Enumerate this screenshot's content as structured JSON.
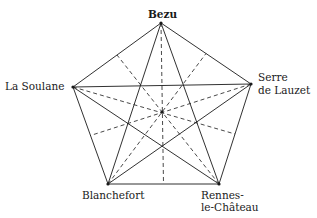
{
  "diagram": {
    "type": "pentagram-in-pentagon",
    "line_color": "#1a1a1a",
    "vertices": [
      {
        "id": "bezu",
        "label_lines": [
          "Bezu"
        ],
        "x": 161,
        "y": 23
      },
      {
        "id": "serre",
        "label_lines": [
          "Serre",
          "de Lauzet"
        ],
        "x": 251,
        "y": 84
      },
      {
        "id": "rennes",
        "label_lines": [
          "Rennes-",
          "le-Château"
        ],
        "x": 219,
        "y": 184
      },
      {
        "id": "blanchefort",
        "label_lines": [
          "Blanchefort"
        ],
        "x": 108,
        "y": 184
      },
      {
        "id": "soulane",
        "label_lines": [
          "La Soulane"
        ],
        "x": 73,
        "y": 87
      }
    ],
    "center": {
      "x": 162,
      "y": 112
    }
  },
  "labels": {
    "bezu": "Bezu",
    "soulane": "La Soulane",
    "serre_1": "Serre",
    "serre_2": "de Lauzet",
    "blanchefort": "Blanchefort",
    "rennes_1": "Rennes-",
    "rennes_2": "le-Château"
  }
}
